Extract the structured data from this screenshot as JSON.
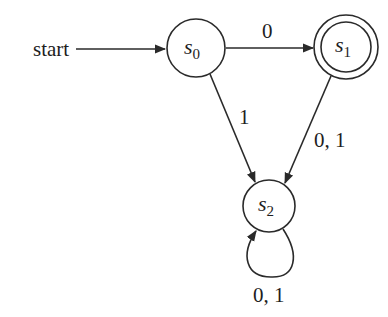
{
  "diagram": {
    "type": "finite-automaton",
    "start_label": "start",
    "states": [
      {
        "id": "s0",
        "name": "s",
        "subscript": "0",
        "accepting": false,
        "initial": true
      },
      {
        "id": "s1",
        "name": "s",
        "subscript": "1",
        "accepting": true,
        "initial": false
      },
      {
        "id": "s2",
        "name": "s",
        "subscript": "2",
        "accepting": false,
        "initial": false
      }
    ],
    "transitions": [
      {
        "from": "s0",
        "to": "s1",
        "label": "0"
      },
      {
        "from": "s0",
        "to": "s2",
        "label": "1"
      },
      {
        "from": "s1",
        "to": "s2",
        "label": "0, 1"
      },
      {
        "from": "s2",
        "to": "s2",
        "label": "0, 1"
      }
    ],
    "colors": {
      "stroke": "#2a2a2a",
      "text": "#1e1e1e",
      "background": "#ffffff"
    }
  }
}
